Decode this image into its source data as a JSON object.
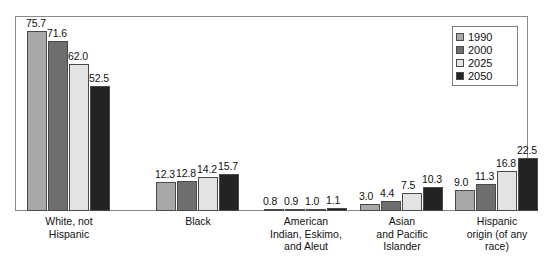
{
  "chart_data": {
    "type": "bar",
    "title": "",
    "subtitle": "",
    "xlabel": "",
    "ylabel": "",
    "grid": false,
    "legend_position": "top-right",
    "ylim": [
      0,
      80
    ],
    "categories": [
      "White, not\nHispanic",
      "Black",
      "American\nIndian, Eskimo,\nand Aleut",
      "Asian\nand Pacific\nIslander",
      "Hispanic\norigin (of any\nrace)"
    ],
    "category_lines": [
      [
        "White, not",
        "Hispanic"
      ],
      [
        "Black"
      ],
      [
        "American",
        "Indian, Eskimo,",
        "and Aleut"
      ],
      [
        "Asian",
        "and Pacific",
        "Islander"
      ],
      [
        "Hispanic",
        "origin (of any",
        "race)"
      ]
    ],
    "series": [
      {
        "name": "1990",
        "color": "#a8a8a8",
        "values": [
          75.7,
          12.3,
          0.8,
          3.0,
          9.0
        ],
        "labels": [
          "75.7",
          "12.3",
          "0.8",
          "3.0",
          "9.0"
        ]
      },
      {
        "name": "2000",
        "color": "#6e6e6e",
        "values": [
          71.6,
          12.8,
          0.9,
          4.4,
          11.3
        ],
        "labels": [
          "71.6",
          "12.8",
          "0.9",
          "4.4",
          "11.3"
        ]
      },
      {
        "name": "2025",
        "color": "#e3e3e3",
        "values": [
          62.0,
          14.2,
          1.0,
          7.5,
          16.8
        ],
        "labels": [
          "62.0",
          "14.2",
          "1.0",
          "7.5",
          "16.8"
        ]
      },
      {
        "name": "2050",
        "color": "#232323",
        "values": [
          52.5,
          15.7,
          1.1,
          10.3,
          22.5
        ],
        "labels": [
          "52.5",
          "15.7",
          "1.1",
          "10.3",
          "22.5"
        ]
      }
    ]
  },
  "legend": {
    "entries": [
      {
        "label": "1990",
        "color": "#a8a8a8"
      },
      {
        "label": "2000",
        "color": "#6e6e6e"
      },
      {
        "label": "2025",
        "color": "#e3e3e3"
      },
      {
        "label": "2050",
        "color": "#232323"
      }
    ]
  }
}
